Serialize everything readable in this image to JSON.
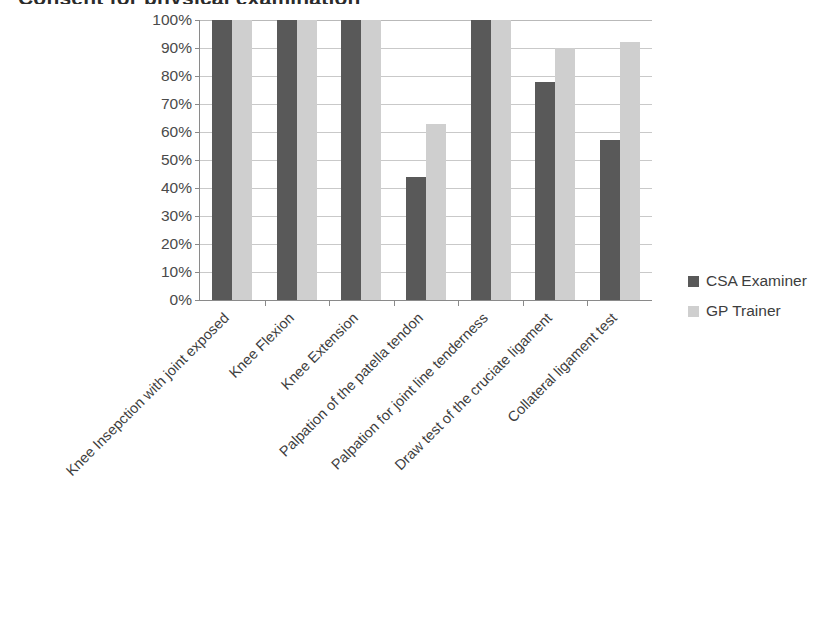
{
  "chart_data": {
    "type": "bar",
    "title": "Consent for physical examination",
    "xlabel": "",
    "ylabel": "",
    "ylim": [
      0,
      100
    ],
    "ytick_labels": [
      "100%",
      "90%",
      "80%",
      "70%",
      "60%",
      "50%",
      "40%",
      "30%",
      "20%",
      "10%",
      "0%"
    ],
    "ytick_values": [
      100,
      90,
      80,
      70,
      60,
      50,
      40,
      30,
      20,
      10,
      0
    ],
    "grid": true,
    "legend_position": "right",
    "categories": [
      "Knee Insepction with joint exposed",
      "Knee Flexion",
      "Knee Extension",
      "Palpation of the patella tendon",
      "Palpation for joint line tenderness",
      "Draw test of the cruciate ligament",
      "Collateral ligament test"
    ],
    "series": [
      {
        "name": "CSA Examiner",
        "color": "#595959",
        "values": [
          100,
          100,
          100,
          44,
          100,
          78,
          57
        ]
      },
      {
        "name": "GP Trainer",
        "color": "#cfcfcf",
        "values": [
          100,
          100,
          100,
          63,
          100,
          90,
          92
        ]
      }
    ]
  },
  "legend": {
    "entries": [
      {
        "label": "CSA Examiner",
        "swatch": "series-0"
      },
      {
        "label": "GP Trainer",
        "swatch": "series-1"
      }
    ]
  }
}
